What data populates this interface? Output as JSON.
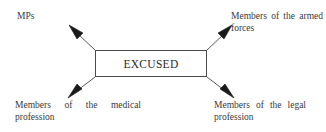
{
  "diagram": {
    "type": "flow-diagram",
    "center_node": {
      "label": "EXCUSED",
      "shape": "rectangle",
      "border_color": "#4a4a4a",
      "fill_color": "#ffffff"
    },
    "branches": [
      {
        "id": "mps",
        "label": "MPs",
        "direction": "up-left",
        "arrow_from": [
          95,
          50
        ],
        "arrow_to": [
          70,
          26
        ]
      },
      {
        "id": "armed-forces",
        "label": "Members of the armed forces",
        "direction": "up-right",
        "arrow_from": [
          207,
          50
        ],
        "arrow_to": [
          230,
          26
        ]
      },
      {
        "id": "medical",
        "label": "Members of the medical profession",
        "direction": "down-left",
        "arrow_from": [
          95,
          77
        ],
        "arrow_to": [
          69,
          97
        ]
      },
      {
        "id": "legal",
        "label": "Members of the legal profession",
        "direction": "down-right",
        "arrow_from": [
          207,
          77
        ],
        "arrow_to": [
          233,
          97
        ]
      }
    ],
    "colors": {
      "background": "#ffffff",
      "text": "#3a3a3a",
      "line": "#4a4a4a",
      "arrowhead": "#1a1a1a"
    }
  }
}
